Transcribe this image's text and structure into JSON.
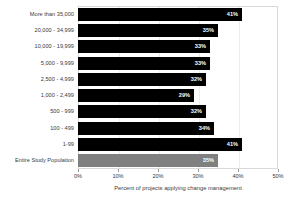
{
  "chart_data": {
    "type": "bar",
    "title": "",
    "subtitle": "",
    "orientation": "horizontal",
    "xlabel": "Percent of projects applying change management",
    "ylabel": "",
    "xlim": [
      0,
      50
    ],
    "xticks": [
      "0%",
      "10%",
      "20%",
      "30%",
      "40%",
      "50%"
    ],
    "xtick_values": [
      0,
      10,
      20,
      30,
      40,
      50
    ],
    "grid": true,
    "legend": "none",
    "categories": [
      "More than 35,000",
      "20,000 - 34,999",
      "10,000 - 19,999",
      "5,000 - 9,999",
      "2,500 - 4,999",
      "1,000 - 2,499",
      "500 - 999",
      "100 - 499",
      "1-99",
      "Entire Study Population"
    ],
    "values": [
      41,
      35,
      33,
      33,
      32,
      29,
      32,
      34,
      41,
      35
    ],
    "value_labels": [
      "41%",
      "35%",
      "33%",
      "33%",
      "32%",
      "29%",
      "32%",
      "34%",
      "41%",
      "35%"
    ],
    "bar_colors": [
      "#000000",
      "#000000",
      "#000000",
      "#000000",
      "#000000",
      "#000000",
      "#000000",
      "#000000",
      "#000000",
      "#808080"
    ],
    "series_note": "Entire Study Population shown in gray; size bands shown in black"
  },
  "colors": {
    "bar_dark": "#000000",
    "bar_light": "#808080",
    "plot_border": "#d9d9d9",
    "gridline": "#ededed",
    "text": "#3a3a3a",
    "value_text": "#ffffff",
    "background": "#ffffff"
  }
}
